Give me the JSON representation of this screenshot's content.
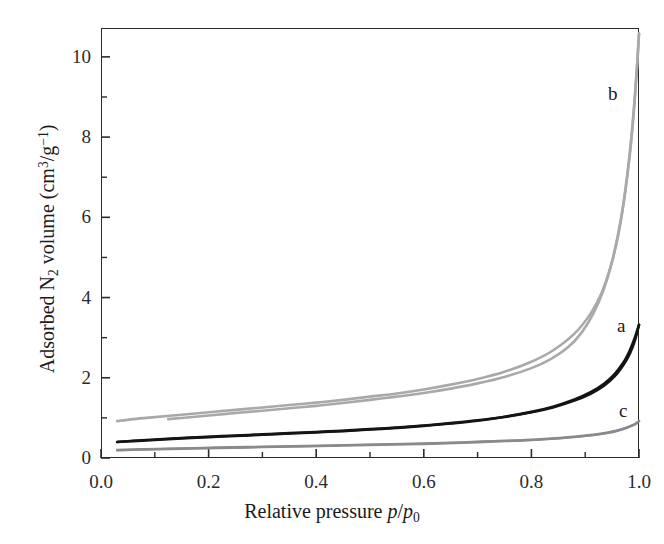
{
  "figure": {
    "background": "#ffffff",
    "frame_color": "#2b2b2b"
  },
  "axes": {
    "x": {
      "title_plain": "Relative pressure",
      "title_symbol_num": "p",
      "title_symbol_den": "p",
      "title_symbol_den_sub": "0",
      "ticks": [
        "0.0",
        "0.2",
        "0.4",
        "0.6",
        "0.8",
        "1.0"
      ],
      "tick_values": [
        0.0,
        0.2,
        0.4,
        0.6,
        0.8,
        1.0
      ],
      "minor_tick_values": [
        0.1,
        0.3,
        0.5,
        0.7,
        0.9
      ],
      "range": [
        0.0,
        1.0
      ]
    },
    "y": {
      "title_plain": "Adsorbed N",
      "title_sub": "2",
      "title_rest": " volume (cm",
      "title_sup1": "3",
      "title_mid": "/g",
      "title_sup2": "−1",
      "title_end": ")",
      "ticks": [
        "0",
        "2",
        "4",
        "6",
        "8",
        "10"
      ],
      "tick_values": [
        0,
        2,
        4,
        6,
        8,
        10
      ],
      "minor_tick_values": [
        1,
        3,
        5,
        7,
        9
      ],
      "range": [
        0,
        10.72
      ]
    }
  },
  "annotations": [
    {
      "id": "a",
      "text": "a",
      "color": "#141414"
    },
    {
      "id": "b",
      "text": "b",
      "color": "#141414"
    },
    {
      "id": "c",
      "text": "c",
      "color": "#141414"
    }
  ],
  "chart_data": {
    "type": "line",
    "title": "",
    "subtitle": "",
    "xlabel": "Relative pressure p/p0",
    "ylabel": "Adsorbed N2 volume (cm3/g-1)",
    "xlim": [
      0.0,
      1.0
    ],
    "ylim": [
      0,
      10.72
    ],
    "grid": false,
    "legend": "inline-curve-labels",
    "x_ticks": [
      0.0,
      0.2,
      0.4,
      0.6,
      0.8,
      1.0
    ],
    "y_ticks": [
      0,
      2,
      4,
      6,
      8,
      10
    ],
    "series": [
      {
        "name": "a-adsorption",
        "label": "a",
        "branch": "adsorption",
        "color": "#141414",
        "width": 2.6,
        "points": [
          [
            0.03,
            0.4
          ],
          [
            0.06,
            0.43
          ],
          [
            0.1,
            0.46
          ],
          [
            0.15,
            0.5
          ],
          [
            0.2,
            0.53
          ],
          [
            0.25,
            0.56
          ],
          [
            0.3,
            0.59
          ],
          [
            0.35,
            0.62
          ],
          [
            0.4,
            0.65
          ],
          [
            0.45,
            0.68
          ],
          [
            0.5,
            0.72
          ],
          [
            0.55,
            0.76
          ],
          [
            0.6,
            0.81
          ],
          [
            0.65,
            0.87
          ],
          [
            0.7,
            0.94
          ],
          [
            0.75,
            1.03
          ],
          [
            0.8,
            1.15
          ],
          [
            0.84,
            1.28
          ],
          [
            0.88,
            1.46
          ],
          [
            0.91,
            1.64
          ],
          [
            0.935,
            1.85
          ],
          [
            0.955,
            2.1
          ],
          [
            0.97,
            2.36
          ],
          [
            0.98,
            2.6
          ],
          [
            0.988,
            2.85
          ],
          [
            0.994,
            3.07
          ],
          [
            1.0,
            3.32
          ]
        ]
      },
      {
        "name": "a-desorption",
        "label": "a",
        "branch": "desorption",
        "color": "#141414",
        "width": 2.6,
        "points": [
          [
            1.0,
            3.32
          ],
          [
            0.994,
            3.0
          ],
          [
            0.988,
            2.76
          ],
          [
            0.98,
            2.52
          ],
          [
            0.97,
            2.3
          ],
          [
            0.955,
            2.04
          ],
          [
            0.935,
            1.8
          ],
          [
            0.91,
            1.6
          ],
          [
            0.88,
            1.43
          ],
          [
            0.84,
            1.26
          ],
          [
            0.8,
            1.14
          ],
          [
            0.75,
            1.02
          ],
          [
            0.7,
            0.93
          ],
          [
            0.65,
            0.86
          ],
          [
            0.6,
            0.8
          ],
          [
            0.55,
            0.75
          ],
          [
            0.5,
            0.71
          ],
          [
            0.45,
            0.67
          ],
          [
            0.4,
            0.64
          ],
          [
            0.35,
            0.61
          ],
          [
            0.3,
            0.58
          ],
          [
            0.25,
            0.55
          ],
          [
            0.2,
            0.52
          ],
          [
            0.15,
            0.49
          ],
          [
            0.1,
            0.45
          ],
          [
            0.06,
            0.42
          ],
          [
            0.03,
            0.4
          ]
        ]
      },
      {
        "name": "b-adsorption",
        "label": "b",
        "branch": "adsorption",
        "color": "#a9a9a9",
        "width": 2.6,
        "points": [
          [
            0.03,
            0.92
          ],
          [
            0.06,
            0.97
          ],
          [
            0.1,
            1.02
          ],
          [
            0.15,
            1.08
          ],
          [
            0.2,
            1.14
          ],
          [
            0.25,
            1.2
          ],
          [
            0.3,
            1.26
          ],
          [
            0.35,
            1.32
          ],
          [
            0.4,
            1.38
          ],
          [
            0.45,
            1.45
          ],
          [
            0.5,
            1.53
          ],
          [
            0.55,
            1.61
          ],
          [
            0.6,
            1.71
          ],
          [
            0.65,
            1.83
          ],
          [
            0.7,
            1.97
          ],
          [
            0.75,
            2.15
          ],
          [
            0.8,
            2.4
          ],
          [
            0.84,
            2.68
          ],
          [
            0.88,
            3.1
          ],
          [
            0.91,
            3.6
          ],
          [
            0.93,
            4.1
          ],
          [
            0.948,
            4.8
          ],
          [
            0.962,
            5.6
          ],
          [
            0.972,
            6.4
          ],
          [
            0.98,
            7.2
          ],
          [
            0.987,
            8.1
          ],
          [
            0.993,
            9.1
          ],
          [
            0.997,
            9.9
          ],
          [
            1.0,
            10.58
          ]
        ]
      },
      {
        "name": "b-desorption",
        "label": "b",
        "branch": "desorption",
        "color": "#a9a9a9",
        "width": 2.6,
        "points": [
          [
            1.0,
            10.58
          ],
          [
            0.996,
            9.7
          ],
          [
            0.991,
            8.8
          ],
          [
            0.985,
            7.9
          ],
          [
            0.978,
            7.05
          ],
          [
            0.97,
            6.25
          ],
          [
            0.96,
            5.5
          ],
          [
            0.948,
            4.8
          ],
          [
            0.933,
            4.15
          ],
          [
            0.915,
            3.6
          ],
          [
            0.893,
            3.12
          ],
          [
            0.868,
            2.76
          ],
          [
            0.835,
            2.46
          ],
          [
            0.8,
            2.24
          ],
          [
            0.75,
            2.02
          ],
          [
            0.7,
            1.86
          ],
          [
            0.65,
            1.73
          ],
          [
            0.6,
            1.62
          ],
          [
            0.55,
            1.53
          ],
          [
            0.5,
            1.45
          ],
          [
            0.45,
            1.37
          ],
          [
            0.4,
            1.3
          ],
          [
            0.35,
            1.24
          ],
          [
            0.3,
            1.18
          ],
          [
            0.25,
            1.12
          ],
          [
            0.2,
            1.06
          ],
          [
            0.16,
            1.01
          ],
          [
            0.125,
            0.97
          ]
        ]
      },
      {
        "name": "c-adsorption",
        "label": "c",
        "branch": "adsorption",
        "color": "#8a8a8a",
        "width": 2.4,
        "points": [
          [
            0.03,
            0.2
          ],
          [
            0.08,
            0.22
          ],
          [
            0.15,
            0.24
          ],
          [
            0.22,
            0.26
          ],
          [
            0.3,
            0.28
          ],
          [
            0.38,
            0.3
          ],
          [
            0.45,
            0.32
          ],
          [
            0.52,
            0.34
          ],
          [
            0.6,
            0.36
          ],
          [
            0.67,
            0.39
          ],
          [
            0.73,
            0.42
          ],
          [
            0.79,
            0.45
          ],
          [
            0.84,
            0.49
          ],
          [
            0.88,
            0.53
          ],
          [
            0.915,
            0.58
          ],
          [
            0.94,
            0.63
          ],
          [
            0.96,
            0.69
          ],
          [
            0.975,
            0.75
          ],
          [
            0.986,
            0.81
          ],
          [
            0.994,
            0.86
          ],
          [
            1.0,
            0.92
          ]
        ]
      },
      {
        "name": "c-desorption",
        "label": "c",
        "branch": "desorption",
        "color": "#8a8a8a",
        "width": 2.4,
        "points": [
          [
            1.0,
            0.92
          ],
          [
            0.994,
            0.85
          ],
          [
            0.986,
            0.8
          ],
          [
            0.975,
            0.74
          ],
          [
            0.96,
            0.68
          ],
          [
            0.94,
            0.62
          ],
          [
            0.915,
            0.57
          ],
          [
            0.88,
            0.52
          ],
          [
            0.84,
            0.48
          ],
          [
            0.79,
            0.44
          ],
          [
            0.73,
            0.41
          ],
          [
            0.67,
            0.38
          ],
          [
            0.6,
            0.35
          ],
          [
            0.52,
            0.33
          ],
          [
            0.45,
            0.31
          ],
          [
            0.38,
            0.29
          ],
          [
            0.3,
            0.27
          ],
          [
            0.22,
            0.25
          ],
          [
            0.15,
            0.23
          ],
          [
            0.08,
            0.21
          ],
          [
            0.03,
            0.19
          ]
        ]
      }
    ]
  }
}
